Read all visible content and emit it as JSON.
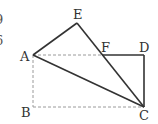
{
  "diagram": {
    "type": "geometry",
    "points": {
      "A": {
        "label": "A",
        "x": 33,
        "y": 55
      },
      "B": {
        "label": "B",
        "x": 33,
        "y": 107
      },
      "C": {
        "label": "C",
        "x": 144,
        "y": 107
      },
      "D": {
        "label": "D",
        "x": 144,
        "y": 55
      },
      "E": {
        "label": "E",
        "x": 77,
        "y": 23
      },
      "F": {
        "label": "F",
        "x": 102,
        "y": 55
      }
    },
    "solid_segments": [
      "AE",
      "EC",
      "AC",
      "FD",
      "DC"
    ],
    "dashed_segments": [
      "AF",
      "AB",
      "BC"
    ],
    "line_color": "#333333",
    "dash_color": "#999999",
    "edge_fragments": [
      "9",
      "6"
    ]
  }
}
